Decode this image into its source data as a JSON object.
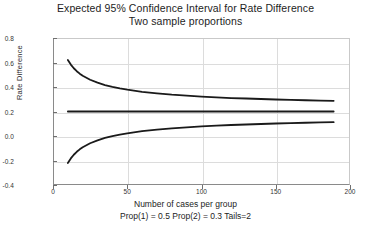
{
  "chart_data": {
    "type": "line",
    "title": "Expected 95% Confidence Interval for Rate Difference",
    "subtitle": "Two sample proportions",
    "xlabel": "Number of cases per group",
    "caption": "Prop(1) = 0.5 Prop(2) = 0.3 Tails=2",
    "ylabel": "Rate Difference",
    "xlim": [
      0,
      200
    ],
    "ylim": [
      -0.4,
      0.8
    ],
    "xticks": [
      0,
      50,
      100,
      150,
      200
    ],
    "yticks": [
      -0.4,
      -0.2,
      0.0,
      0.2,
      0.4,
      0.6,
      0.8
    ],
    "xtick_labels": [
      "0",
      "50",
      "100",
      "150",
      "200"
    ],
    "ytick_labels": [
      "-0.4",
      "-0.2",
      "0.0",
      "0.2",
      "0.4",
      "0.6",
      "0.8"
    ],
    "grid": true,
    "legend": "none",
    "line_color": "#1a1a1a",
    "grid_color": "#dcdcdc",
    "axis_color": "#8a8a8a",
    "n_start": 10,
    "n_end": 189,
    "x": [
      10,
      12,
      14,
      16,
      18,
      20,
      25,
      30,
      35,
      40,
      45,
      50,
      60,
      70,
      80,
      90,
      100,
      110,
      120,
      130,
      140,
      150,
      160,
      170,
      180,
      189
    ],
    "series": [
      {
        "name": "Upper confidence limit",
        "values": [
          0.62,
          0.583,
          0.553,
          0.529,
          0.509,
          0.492,
          0.459,
          0.435,
          0.416,
          0.401,
          0.388,
          0.378,
          0.361,
          0.348,
          0.337,
          0.329,
          0.322,
          0.316,
          0.31,
          0.306,
          0.302,
          0.298,
          0.295,
          0.292,
          0.289,
          0.287
        ]
      },
      {
        "name": "Expected rate difference",
        "values": [
          0.2,
          0.2,
          0.2,
          0.2,
          0.2,
          0.2,
          0.2,
          0.2,
          0.2,
          0.2,
          0.2,
          0.2,
          0.2,
          0.2,
          0.2,
          0.2,
          0.2,
          0.2,
          0.2,
          0.2,
          0.2,
          0.2,
          0.2,
          0.2,
          0.2,
          0.2
        ]
      },
      {
        "name": "Lower confidence limit",
        "values": [
          -0.22,
          -0.183,
          -0.153,
          -0.129,
          -0.109,
          -0.092,
          -0.059,
          -0.035,
          -0.016,
          -0.001,
          0.012,
          0.022,
          0.039,
          0.052,
          0.063,
          0.071,
          0.078,
          0.084,
          0.09,
          0.094,
          0.098,
          0.102,
          0.105,
          0.108,
          0.111,
          0.113
        ]
      }
    ]
  }
}
